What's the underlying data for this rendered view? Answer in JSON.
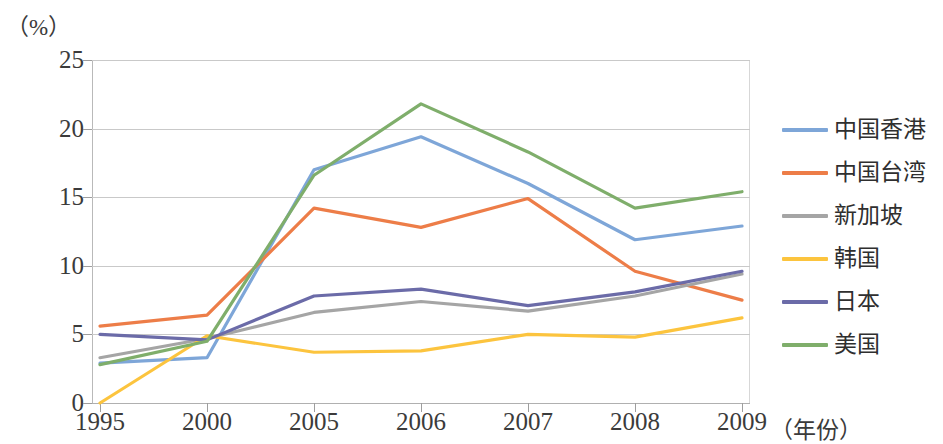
{
  "chart_data": {
    "type": "line",
    "title": "",
    "xlabel": "（年份）",
    "ylabel": "（%）",
    "categories": [
      "1995",
      "2000",
      "2005",
      "2006",
      "2007",
      "2008",
      "2009"
    ],
    "x": [
      1995,
      2000,
      2005,
      2006,
      2007,
      2008,
      2009
    ],
    "ylim": [
      0,
      25
    ],
    "yticks": [
      0,
      5,
      10,
      15,
      20,
      25
    ],
    "grid": true,
    "legend_position": "right",
    "series": [
      {
        "name": "中国香港",
        "color": "#7EA6D8",
        "values": [
          2.9,
          3.3,
          17.0,
          19.4,
          16.0,
          11.9,
          12.9
        ]
      },
      {
        "name": "中国台湾",
        "color": "#ED7D48",
        "values": [
          5.6,
          6.4,
          14.2,
          12.8,
          14.9,
          9.6,
          7.5
        ]
      },
      {
        "name": "新加坡",
        "color": "#A5A5A5",
        "values": [
          3.3,
          4.7,
          6.6,
          7.4,
          6.7,
          7.8,
          9.4
        ]
      },
      {
        "name": "韩国",
        "color": "#FCC43E",
        "values": [
          0.0,
          4.9,
          3.7,
          3.8,
          5.0,
          4.8,
          6.2
        ]
      },
      {
        "name": "日本",
        "color": "#6B6BA8",
        "values": [
          5.0,
          4.6,
          7.8,
          8.3,
          7.1,
          8.1,
          9.6
        ]
      },
      {
        "name": "美国",
        "color": "#7FAE6B",
        "values": [
          2.8,
          4.5,
          16.6,
          21.8,
          18.3,
          14.2,
          15.4
        ]
      }
    ]
  },
  "axis": {
    "y_unit_label": "（%）",
    "x_axis_title": "（年份）",
    "y_tick_labels": [
      "25",
      "20",
      "15",
      "10",
      "5",
      "0"
    ],
    "x_tick_labels": [
      "1995",
      "2000",
      "2005",
      "2006",
      "2007",
      "2008",
      "2009"
    ]
  }
}
